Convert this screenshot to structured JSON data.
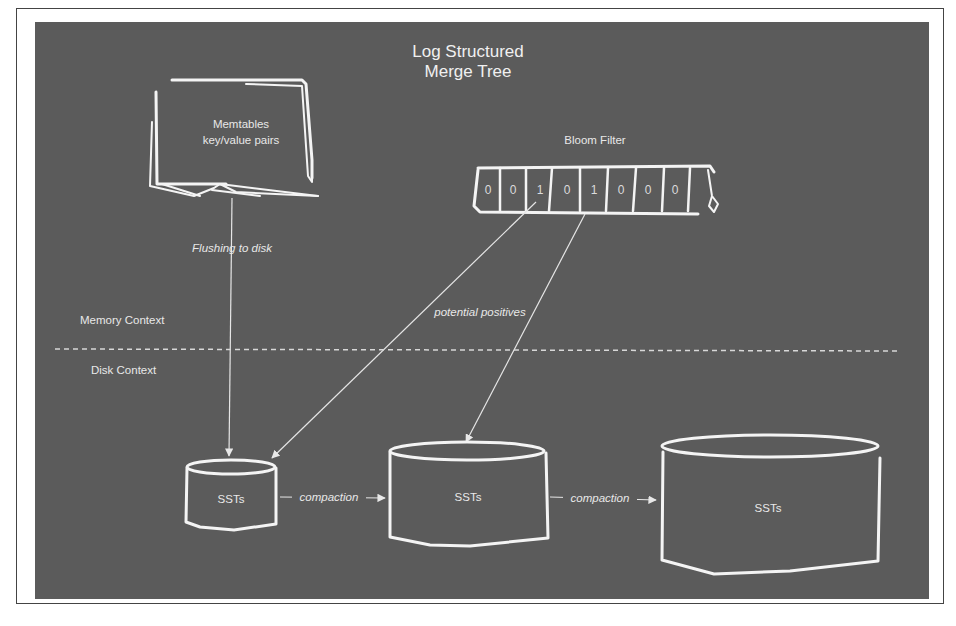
{
  "diagram": {
    "title_line1": "Log Structured",
    "title_line2": "Merge Tree",
    "memtable": {
      "line1": "Memtables",
      "line2": "key/value pairs"
    },
    "flush_label": "Flushing to disk",
    "bloom_filter": {
      "label": "Bloom Filter",
      "bits": [
        "0",
        "0",
        "1",
        "0",
        "1",
        "0",
        "0",
        "0"
      ]
    },
    "potential_positives_label": "potential positives",
    "memory_context_label": "Memory Context",
    "disk_context_label": "Disk Context",
    "sst_levels": [
      {
        "label": "SSTs"
      },
      {
        "label": "SSTs"
      },
      {
        "label": "SSTs"
      }
    ],
    "compaction_labels": [
      "compaction",
      "compaction"
    ],
    "colors": {
      "background": "#5b5b5b",
      "stroke": "#f4f4f4",
      "frame": "#ffffff"
    }
  }
}
